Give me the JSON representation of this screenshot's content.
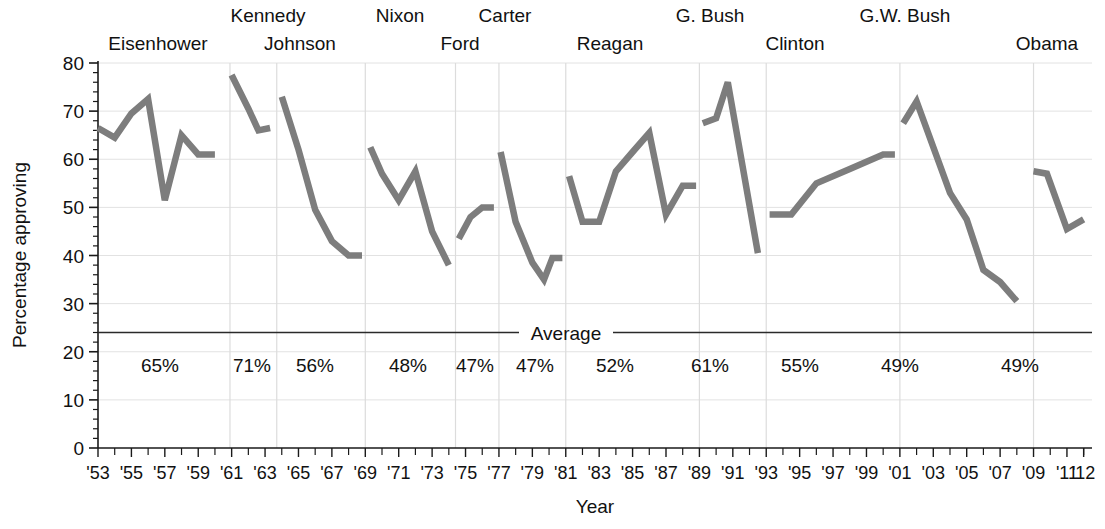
{
  "chart_data": {
    "type": "line",
    "title": "",
    "xlabel": "Year",
    "ylabel": "Percentage approving",
    "ylim": [
      0,
      80
    ],
    "ytick_values": [
      0,
      10,
      20,
      30,
      40,
      50,
      60,
      70,
      80
    ],
    "ytick_labels": [
      "0",
      "10",
      "20",
      "30",
      "40",
      "50",
      "60",
      "70",
      "80"
    ],
    "xlim": [
      1953,
      2012.5
    ],
    "xtick_labels": [
      "'53",
      "'55",
      "'57",
      "'59",
      "'61",
      "'63",
      "'65",
      "'67",
      "'69",
      "'71",
      "'73",
      "'75",
      "'77",
      "'79",
      "'81",
      "'83",
      "'85",
      "'87",
      "'89",
      "'91",
      "'93",
      "'95",
      "'97",
      "'99",
      "'01",
      "'03",
      "'05",
      "'07",
      "'09",
      "'11",
      "'12"
    ],
    "xtick_values": [
      1953,
      1955,
      1957,
      1959,
      1961,
      1963,
      1965,
      1967,
      1969,
      1971,
      1973,
      1975,
      1977,
      1979,
      1981,
      1983,
      1985,
      1987,
      1989,
      1991,
      1993,
      1995,
      1997,
      1999,
      2001,
      2003,
      2005,
      2007,
      2009,
      2011,
      2012
    ],
    "grid": "both-light",
    "legend": "none",
    "series_color": "#7d7d7d",
    "average_line": {
      "label": "Average",
      "value": 24,
      "color": "#2a2a2a"
    },
    "series": [
      {
        "name": "Eisenhower",
        "avg_label": "65%",
        "points": [
          {
            "x": 1953.0,
            "y": 66.5
          },
          {
            "x": 1954.0,
            "y": 64.5
          },
          {
            "x": 1955.0,
            "y": 69.5
          },
          {
            "x": 1956.0,
            "y": 72.5
          },
          {
            "x": 1957.0,
            "y": 51.5
          },
          {
            "x": 1958.0,
            "y": 65.0
          },
          {
            "x": 1959.0,
            "y": 61.0
          },
          {
            "x": 1960.0,
            "y": 61.0
          }
        ]
      },
      {
        "name": "Kennedy",
        "avg_label": "71%",
        "points": [
          {
            "x": 1961.0,
            "y": 77.5
          },
          {
            "x": 1962.0,
            "y": 70.5
          },
          {
            "x": 1962.6,
            "y": 66.0
          },
          {
            "x": 1963.3,
            "y": 66.5
          }
        ]
      },
      {
        "name": "Johnson",
        "avg_label": "56%",
        "points": [
          {
            "x": 1964.0,
            "y": 73.0
          },
          {
            "x": 1965.0,
            "y": 62.0
          },
          {
            "x": 1966.0,
            "y": 49.5
          },
          {
            "x": 1967.0,
            "y": 43.0
          },
          {
            "x": 1968.0,
            "y": 40.0
          },
          {
            "x": 1968.8,
            "y": 40.0
          }
        ]
      },
      {
        "name": "Nixon",
        "avg_label": "48%",
        "points": [
          {
            "x": 1969.3,
            "y": 62.5
          },
          {
            "x": 1970.0,
            "y": 57.0
          },
          {
            "x": 1971.0,
            "y": 51.5
          },
          {
            "x": 1972.0,
            "y": 57.5
          },
          {
            "x": 1973.0,
            "y": 45.0
          },
          {
            "x": 1974.0,
            "y": 38.0
          }
        ]
      },
      {
        "name": "Ford",
        "avg_label": "47%",
        "points": [
          {
            "x": 1974.6,
            "y": 43.5
          },
          {
            "x": 1975.3,
            "y": 48.0
          },
          {
            "x": 1976.0,
            "y": 50.0
          },
          {
            "x": 1976.7,
            "y": 50.0
          }
        ]
      },
      {
        "name": "Carter",
        "avg_label": "47%",
        "points": [
          {
            "x": 1977.1,
            "y": 61.5
          },
          {
            "x": 1978.0,
            "y": 47.0
          },
          {
            "x": 1979.0,
            "y": 38.5
          },
          {
            "x": 1979.7,
            "y": 35.0
          },
          {
            "x": 1980.2,
            "y": 39.5
          },
          {
            "x": 1980.8,
            "y": 39.5
          }
        ]
      },
      {
        "name": "Reagan",
        "avg_label": "52%",
        "points": [
          {
            "x": 1981.2,
            "y": 56.5
          },
          {
            "x": 1982.0,
            "y": 47.0
          },
          {
            "x": 1983.0,
            "y": 47.0
          },
          {
            "x": 1984.0,
            "y": 57.5
          },
          {
            "x": 1985.0,
            "y": 61.5
          },
          {
            "x": 1986.0,
            "y": 65.5
          },
          {
            "x": 1987.0,
            "y": 48.5
          },
          {
            "x": 1988.0,
            "y": 54.5
          },
          {
            "x": 1988.8,
            "y": 54.5
          }
        ]
      },
      {
        "name": "G. Bush",
        "avg_label": "61%",
        "points": [
          {
            "x": 1989.2,
            "y": 67.5
          },
          {
            "x": 1990.0,
            "y": 68.5
          },
          {
            "x": 1990.7,
            "y": 76.0
          },
          {
            "x": 1992.5,
            "y": 40.5
          }
        ]
      },
      {
        "name": "Clinton",
        "avg_label": "55%",
        "points": [
          {
            "x": 1993.2,
            "y": 48.5
          },
          {
            "x": 1994.5,
            "y": 48.5
          },
          {
            "x": 1996.0,
            "y": 55.0
          },
          {
            "x": 1998.0,
            "y": 58.0
          },
          {
            "x": 2000.0,
            "y": 61.0
          },
          {
            "x": 2000.7,
            "y": 61.0
          }
        ]
      },
      {
        "name": "G.W. Bush",
        "avg_label": "49%",
        "points": [
          {
            "x": 2001.2,
            "y": 67.5
          },
          {
            "x": 2002.0,
            "y": 72.0
          },
          {
            "x": 2004.0,
            "y": 53.0
          },
          {
            "x": 2005.0,
            "y": 47.5
          },
          {
            "x": 2006.0,
            "y": 37.0
          },
          {
            "x": 2007.0,
            "y": 34.5
          },
          {
            "x": 2008.0,
            "y": 30.5
          }
        ]
      },
      {
        "name": "Obama",
        "avg_label": "49%",
        "points": [
          {
            "x": 2009.0,
            "y": 57.5
          },
          {
            "x": 2009.8,
            "y": 57.0
          },
          {
            "x": 2011.0,
            "y": 45.5
          },
          {
            "x": 2012.0,
            "y": 47.5
          }
        ]
      }
    ],
    "president_labels": [
      {
        "text": "Eisenhower",
        "x": 158,
        "row": 1
      },
      {
        "text": "Kennedy",
        "x": 268,
        "row": 0
      },
      {
        "text": "Johnson",
        "x": 300,
        "row": 1
      },
      {
        "text": "Nixon",
        "x": 400,
        "row": 0
      },
      {
        "text": "Ford",
        "x": 460,
        "row": 1
      },
      {
        "text": "Carter",
        "x": 505,
        "row": 0
      },
      {
        "text": "Reagan",
        "x": 610,
        "row": 1
      },
      {
        "text": "G. Bush",
        "x": 710,
        "row": 0
      },
      {
        "text": "Clinton",
        "x": 795,
        "row": 1
      },
      {
        "text": "G.W. Bush",
        "x": 905,
        "row": 0
      },
      {
        "text": "Obama",
        "x": 1047,
        "row": 1
      }
    ],
    "pct_labels": [
      {
        "text": "65%",
        "x": 160
      },
      {
        "text": "71%",
        "x": 252
      },
      {
        "text": "56%",
        "x": 315
      },
      {
        "text": "48%",
        "x": 408
      },
      {
        "text": "47%",
        "x": 475
      },
      {
        "text": "47%",
        "x": 535
      },
      {
        "text": "52%",
        "x": 615
      },
      {
        "text": "61%",
        "x": 710
      },
      {
        "text": "55%",
        "x": 800
      },
      {
        "text": "49%",
        "x": 900
      },
      {
        "text": "49%",
        "x": 1020
      }
    ],
    "president_dividers": [
      1960.9,
      1963.7,
      1969.0,
      1974.4,
      1977.0,
      1981.0,
      1989.0,
      1993.0,
      2001.0,
      2009.0
    ]
  }
}
